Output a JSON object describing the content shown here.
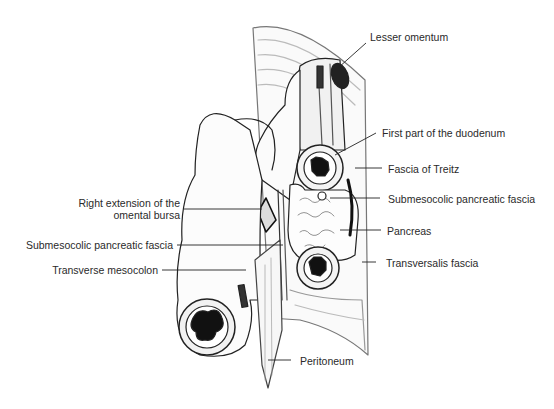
{
  "figure": {
    "type": "anatomical-illustration",
    "labels": {
      "lesser_omentum": "Lesser omentum",
      "first_part_duodenum": "First part of the duodenum",
      "fascia_of_treitz": "Fascia of Treitz",
      "submesocolic_right": "Submesocolic pancreatic fascia",
      "pancreas": "Pancreas",
      "transversalis_fascia": "Transversalis fascia",
      "right_extension_line1": "Right extension of the",
      "right_extension_line2": "omental bursa",
      "submesocolic_left": "Submesocolic pancreatic fascia",
      "transverse_mesocolon": "Transverse mesocolon",
      "peritoneum": "Peritoneum"
    }
  }
}
